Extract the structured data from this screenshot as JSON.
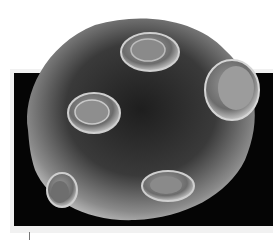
{
  "image": {
    "description": "Grayscale scanning electron micrograph of a round spore/grain with raised oval pores on a black background panel",
    "colors": {
      "background": "#ffffff",
      "panel": "#050505",
      "body_light": "#bdbdbd",
      "body_dark": "#2a2a2a"
    }
  }
}
